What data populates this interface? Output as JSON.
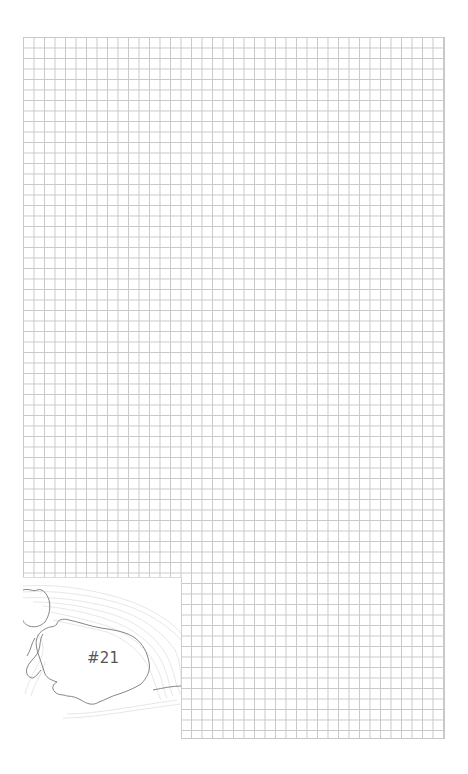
{
  "page": {
    "background": "#ffffff",
    "grid": {
      "line_color": "#c8c8c8",
      "cell_size_px": 10.5,
      "columns": 40,
      "rows": 67
    }
  },
  "inset_map": {
    "label": "#21",
    "label_color": "#555555",
    "coastline_color": "#777777",
    "contour_color": "#cccccc",
    "features": [
      "island-outline",
      "bathymetric-contours",
      "small-islet-left"
    ]
  }
}
